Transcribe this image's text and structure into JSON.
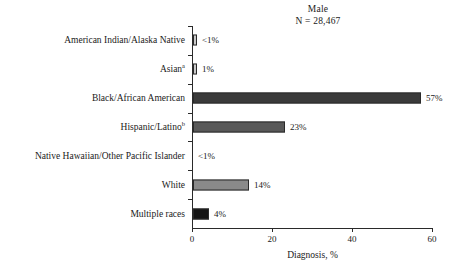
{
  "figure": {
    "title": "Male",
    "subtitle": "N = 28,467"
  },
  "chart_data": {
    "type": "bar",
    "orientation": "horizontal",
    "title": "Male",
    "subtitle": "N = 28,467",
    "xlabel": "Diagnosis, %",
    "ylabel": "",
    "xlim": [
      0,
      60
    ],
    "xticks": [
      0,
      20,
      40,
      60
    ],
    "xtick_labels": [
      "0",
      "20",
      "40",
      "60"
    ],
    "grid": false,
    "legend": false,
    "categories": [
      "American Indian/Alaska Native",
      "Asian",
      "Black/African American",
      "Hispanic/Latino",
      "Native Hawaiian/Other Pacific Islander",
      "White",
      "Multiple races"
    ],
    "values": [
      0.5,
      1,
      57,
      23,
      0,
      14,
      4
    ],
    "value_labels": [
      "<1%",
      "1%",
      "57%",
      "23%",
      "<1%",
      "14%",
      "4%"
    ],
    "bar_colors": [
      "#c9c9c9",
      "#c9c9c9",
      "#3a3a3a",
      "#585858",
      "#ffffff",
      "#8a8a8a",
      "#141414"
    ],
    "footnote_markers": [
      "",
      "a",
      "",
      "b",
      "",
      "",
      ""
    ]
  },
  "bars": [
    {
      "label": "American Indian/Alaska Native",
      "marker": "",
      "value_label": "<1%",
      "value": 0.5,
      "color": "#c9c9c9"
    },
    {
      "label": "Asian",
      "marker": "a",
      "value_label": "1%",
      "value": 1,
      "color": "#c9c9c9"
    },
    {
      "label": "Black/African American",
      "marker": "",
      "value_label": "57%",
      "value": 57,
      "color": "#3a3a3a"
    },
    {
      "label": "Hispanic/Latino",
      "marker": "b",
      "value_label": "23%",
      "value": 23,
      "color": "#585858"
    },
    {
      "label": "Native Hawaiian/Other Pacific Islander",
      "marker": "",
      "value_label": "<1%",
      "value": 0,
      "color": "#ffffff"
    },
    {
      "label": "White",
      "marker": "",
      "value_label": "14%",
      "value": 14,
      "color": "#8a8a8a"
    },
    {
      "label": "Multiple races",
      "marker": "",
      "value_label": "4%",
      "value": 4,
      "color": "#141414"
    }
  ],
  "axis": {
    "x_title": "Diagnosis, %",
    "ticks": [
      {
        "label": "0",
        "value": 0
      },
      {
        "label": "20",
        "value": 20
      },
      {
        "label": "40",
        "value": 40
      },
      {
        "label": "60",
        "value": 60
      }
    ]
  }
}
